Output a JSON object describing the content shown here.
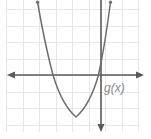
{
  "figure": {
    "width": 151,
    "height": 139,
    "background": "#ffffff"
  },
  "grid": {
    "color": "#e7e7e7",
    "spacing": 16.5,
    "x_start": 6,
    "x_end": 140,
    "y_start": 0,
    "y_end": 132,
    "visible": true
  },
  "axes": {
    "color": "#5a5a5a",
    "x_axis": {
      "name": "x-axis",
      "y": 75,
      "from": 8,
      "to": 143,
      "arrow_left": true,
      "arrow_right": true
    },
    "y_axis": {
      "name": "y-axis",
      "x": 101,
      "from": 0,
      "to": 130,
      "arrow_top": false,
      "arrow_bottom": true
    }
  },
  "curve": {
    "name": "parabola",
    "label": "g(x)",
    "color": "#6e6e6e",
    "vertex": {
      "x": 76,
      "y": 117
    },
    "x_intercepts": [
      53,
      103
    ],
    "left_branch_top": {
      "x": 37,
      "y": 2
    },
    "right_branch_top": {
      "x": 110,
      "y": 2
    },
    "opens": "up",
    "path": "M 37.5 2 Q 45 45 53 75 Q 62 105 76 117 Q 90 105 98.5 75 Q 105 45 110.5 2"
  },
  "label": {
    "text": "g(x)",
    "x": 104,
    "y": 89,
    "color": "#8a8a8a"
  },
  "chart_data": {
    "type": "line",
    "title": "",
    "xlabel": "",
    "ylabel": "",
    "grid": true,
    "legend_position": "inline",
    "series": [
      {
        "name": "g(x)",
        "roots": [
          -3,
          0.1
        ],
        "vertex": [
          -1.5,
          -2.5
        ],
        "opens": "upward",
        "description": "Upward-opening parabola with vertex below the x-axis, left of the y-axis"
      }
    ]
  }
}
